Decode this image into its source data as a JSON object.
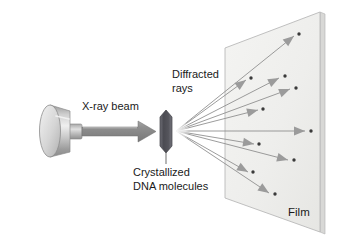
{
  "figure": {
    "background_color": "#ffffff"
  },
  "labels": {
    "beam": "X-ray beam",
    "diffracted_line1": "Diffracted",
    "diffracted_line2": "rays",
    "crystal_line1": "Crystallized",
    "crystal_line2": "DNA molecules",
    "film": "Film"
  },
  "colors": {
    "line": "#8a8a8a",
    "line_dark": "#6f6f6f",
    "dot": "#3a3a3a",
    "film_fill": "#f0f0ee",
    "film_stroke": "#b9b9b9",
    "film_edge_fill": "#d8d8d6",
    "crystal_dark": "#4a4a50",
    "crystal_mid": "#6b6b72",
    "source_light": "#e8e8e8",
    "source_mid": "#b5b5b5",
    "source_dark": "#8f8f8f",
    "beam_arrow": "#8a8a8a",
    "text": "#1a1a1a"
  },
  "components": {
    "source": {
      "name": "x-ray-tube",
      "cx": 50,
      "cy": 131,
      "rx": 10,
      "ry": 26
    },
    "crystal": {
      "name": "dna-crystal",
      "cx": 166,
      "cy": 131
    },
    "fan_origin": {
      "x": 176,
      "y": 131
    },
    "film_panel": {
      "name": "detector-film",
      "corners": [
        [
          225,
          48
        ],
        [
          320,
          12
        ],
        [
          320,
          232
        ],
        [
          225,
          198
        ]
      ]
    }
  },
  "diffracted_rays": [
    {
      "id": "ray-1",
      "end_x": 294,
      "end_y": 36,
      "dot_x": 299,
      "dot_y": 34
    },
    {
      "id": "ray-2",
      "end_x": 246,
      "end_y": 80,
      "dot_x": 251,
      "dot_y": 78
    },
    {
      "id": "ray-3",
      "end_x": 279,
      "end_y": 78,
      "dot_x": 285,
      "dot_y": 76
    },
    {
      "id": "ray-4",
      "end_x": 290,
      "end_y": 89,
      "dot_x": 296,
      "dot_y": 88
    },
    {
      "id": "ray-5",
      "end_x": 258,
      "end_y": 110,
      "dot_x": 263,
      "dot_y": 109
    },
    {
      "id": "ray-6",
      "end_x": 305,
      "end_y": 131,
      "dot_x": 311,
      "dot_y": 131
    },
    {
      "id": "ray-7",
      "end_x": 254,
      "end_y": 144,
      "dot_x": 259,
      "dot_y": 144
    },
    {
      "id": "ray-8",
      "end_x": 288,
      "end_y": 160,
      "dot_x": 294,
      "dot_y": 160
    },
    {
      "id": "ray-9",
      "end_x": 248,
      "end_y": 172,
      "dot_x": 253,
      "dot_y": 172
    },
    {
      "id": "ray-10",
      "end_x": 269,
      "end_y": 193,
      "dot_x": 275,
      "dot_y": 194
    }
  ]
}
